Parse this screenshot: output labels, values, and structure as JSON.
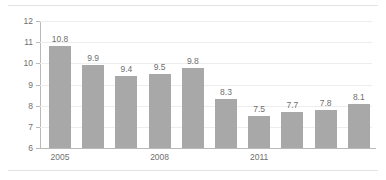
{
  "chart_data": {
    "type": "bar",
    "title": "",
    "subtitle": "",
    "xlabel": "",
    "ylabel": "",
    "categories": [
      "2005",
      "2006",
      "2007",
      "2008",
      "2009",
      "2010",
      "2011",
      "2012",
      "2013",
      "2014"
    ],
    "values": [
      10.8,
      9.9,
      9.4,
      9.5,
      9.8,
      8.3,
      7.5,
      7.7,
      7.8,
      8.1
    ],
    "data_labels": [
      "10.8",
      "9.9",
      "9.4",
      "9.5",
      "9.8",
      "8.3",
      "7.5",
      "7.7",
      "7.8",
      "8.1"
    ],
    "visible_tick_labels": [
      "2005",
      "2008",
      "2011"
    ],
    "visible_tick_indices": [
      0,
      3,
      6
    ],
    "ylim": [
      6,
      12
    ],
    "yticks": [
      6,
      7,
      8,
      9,
      10,
      11,
      12
    ],
    "ytick_labels": [
      "6",
      "7",
      "8",
      "9",
      "10",
      "11",
      "12"
    ],
    "grid": true,
    "legend": false,
    "legend_position": "none",
    "series": [
      {
        "name": "",
        "values": [
          10.8,
          9.9,
          9.4,
          9.5,
          9.8,
          8.3,
          7.5,
          7.7,
          7.8,
          8.1
        ]
      }
    ],
    "colors": {
      "bar_fill": "#a8a8a8",
      "axis": "#b9b9b9",
      "gridline": "#ededed",
      "text": "#6f6f6f",
      "background": "#ffffff",
      "page_rule": "#e3e3e3"
    }
  }
}
